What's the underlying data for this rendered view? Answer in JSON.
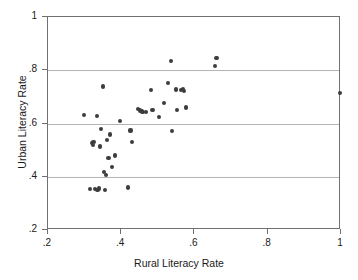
{
  "chart_data": {
    "type": "scatter",
    "title": "",
    "xlabel": "Rural Literacy Rate",
    "ylabel": "Urban Literacy Rate",
    "xlim": [
      0.2,
      1.0
    ],
    "ylim": [
      0.2,
      1.0
    ],
    "xticks": [
      ".2",
      ".4",
      ".6",
      ".8",
      "1"
    ],
    "xtick_values": [
      0.2,
      0.4,
      0.6,
      0.8,
      1.0
    ],
    "yticks": [
      ".2",
      ".4",
      ".6",
      ".8",
      "1"
    ],
    "ytick_values": [
      0.2,
      0.4,
      0.6,
      0.8,
      1.0
    ],
    "grid": "horizontal",
    "gridlines_y": [
      0.4,
      0.6,
      0.8
    ],
    "legend": null,
    "marker_color": "#3d3d3d",
    "marker_shape": "circle",
    "n_points": 50,
    "points": [
      {
        "x": 0.3,
        "y": 0.628
      },
      {
        "x": 0.318,
        "y": 0.35
      },
      {
        "x": 0.322,
        "y": 0.522
      },
      {
        "x": 0.325,
        "y": 0.516
      },
      {
        "x": 0.327,
        "y": 0.528
      },
      {
        "x": 0.331,
        "y": 0.349
      },
      {
        "x": 0.336,
        "y": 0.624
      },
      {
        "x": 0.338,
        "y": 0.345
      },
      {
        "x": 0.341,
        "y": 0.352
      },
      {
        "x": 0.344,
        "y": 0.51
      },
      {
        "x": 0.348,
        "y": 0.575
      },
      {
        "x": 0.353,
        "y": 0.735
      },
      {
        "x": 0.356,
        "y": 0.414
      },
      {
        "x": 0.358,
        "y": 0.348
      },
      {
        "x": 0.361,
        "y": 0.404
      },
      {
        "x": 0.363,
        "y": 0.534
      },
      {
        "x": 0.368,
        "y": 0.466
      },
      {
        "x": 0.372,
        "y": 0.555
      },
      {
        "x": 0.377,
        "y": 0.432
      },
      {
        "x": 0.386,
        "y": 0.476
      },
      {
        "x": 0.4,
        "y": 0.606
      },
      {
        "x": 0.421,
        "y": 0.356
      },
      {
        "x": 0.428,
        "y": 0.57
      },
      {
        "x": 0.433,
        "y": 0.527
      },
      {
        "x": 0.449,
        "y": 0.651
      },
      {
        "x": 0.455,
        "y": 0.645
      },
      {
        "x": 0.459,
        "y": 0.641
      },
      {
        "x": 0.463,
        "y": 0.639
      },
      {
        "x": 0.47,
        "y": 0.64
      },
      {
        "x": 0.483,
        "y": 0.722
      },
      {
        "x": 0.488,
        "y": 0.646
      },
      {
        "x": 0.505,
        "y": 0.622
      },
      {
        "x": 0.519,
        "y": 0.673
      },
      {
        "x": 0.531,
        "y": 0.749
      },
      {
        "x": 0.538,
        "y": 0.83
      },
      {
        "x": 0.541,
        "y": 0.567
      },
      {
        "x": 0.552,
        "y": 0.724
      },
      {
        "x": 0.556,
        "y": 0.648
      },
      {
        "x": 0.566,
        "y": 0.723
      },
      {
        "x": 0.571,
        "y": 0.726
      },
      {
        "x": 0.575,
        "y": 0.719
      },
      {
        "x": 0.58,
        "y": 0.656
      },
      {
        "x": 0.659,
        "y": 0.812
      },
      {
        "x": 0.663,
        "y": 0.843
      },
      {
        "x": 1.0,
        "y": 0.71
      }
    ]
  }
}
